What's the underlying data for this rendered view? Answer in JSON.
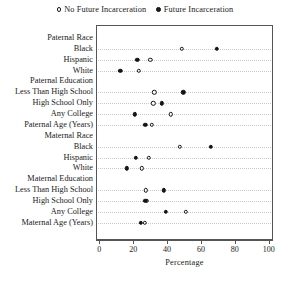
{
  "chart_data": {
    "type": "scatter",
    "title": "",
    "xlabel": "Percentage",
    "ylabel": "",
    "xlim": [
      0,
      100
    ],
    "xticks": [
      0,
      20,
      40,
      60,
      80,
      100
    ],
    "grid": true,
    "legend_position": "top-center",
    "legend": [
      {
        "label": "No Future Incarceration",
        "marker": "open-circle"
      },
      {
        "label": "Future Incarceration",
        "marker": "filled-circle"
      }
    ],
    "series": [
      {
        "name": "No Future Incarceration",
        "marker": "open-circle",
        "values": [
          null,
          48.2,
          29.5,
          22.6,
          null,
          31.9,
          31.3,
          41.7,
          30.3,
          null,
          46.9,
          28.5,
          24.4,
          null,
          27.0,
          27.4,
          50.6,
          26.2
        ]
      },
      {
        "name": "Future Incarceration",
        "marker": "filled-circle",
        "values": [
          null,
          68.7,
          21.8,
          11.8,
          null,
          49.0,
          36.2,
          20.5,
          26.6,
          null,
          65.4,
          20.9,
          15.6,
          null,
          37.4,
          26.6,
          38.8,
          23.8
        ]
      }
    ],
    "categories": [
      {
        "label": "Paternal Race",
        "type": "header"
      },
      {
        "label": "Black",
        "type": "item"
      },
      {
        "label": "Hispanic",
        "type": "item"
      },
      {
        "label": "White",
        "type": "item"
      },
      {
        "label": "Paternal Education",
        "type": "header"
      },
      {
        "label": "Less Than High School",
        "type": "item"
      },
      {
        "label": "High School Only",
        "type": "item"
      },
      {
        "label": "Any College",
        "type": "item"
      },
      {
        "label": "Paternal Age (Years)",
        "type": "item"
      },
      {
        "label": "Maternal Race",
        "type": "header"
      },
      {
        "label": "Black",
        "type": "item"
      },
      {
        "label": "Hispanic",
        "type": "item"
      },
      {
        "label": "White",
        "type": "item"
      },
      {
        "label": "Maternal Education",
        "type": "header"
      },
      {
        "label": "Less Than High School",
        "type": "item"
      },
      {
        "label": "High School Only",
        "type": "item"
      },
      {
        "label": "Any College",
        "type": "item"
      },
      {
        "label": "Maternal Age (Years)",
        "type": "item"
      }
    ]
  }
}
